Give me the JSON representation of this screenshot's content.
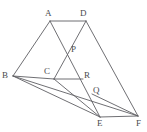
{
  "figure": {
    "canvas": {
      "width": 147,
      "height": 132
    },
    "background_color": "#ffffff",
    "stroke_color": "#5f5f63",
    "label_color": "#4a4a4e",
    "points": [
      {
        "id": "A",
        "label": "A",
        "x": 50,
        "y": 21,
        "label_x": 45,
        "label_y": 9,
        "kind": "vertex"
      },
      {
        "id": "D",
        "label": "D",
        "x": 86,
        "y": 21,
        "label_x": 80,
        "label_y": 9,
        "kind": "vertex"
      },
      {
        "id": "P",
        "label": "P",
        "x": 70,
        "y": 50,
        "label_x": 71,
        "label_y": 46,
        "kind": "intersection"
      },
      {
        "id": "B",
        "label": "B",
        "x": 13,
        "y": 76,
        "label_x": 2,
        "label_y": 71,
        "kind": "vertex"
      },
      {
        "id": "C",
        "label": "C",
        "x": 54,
        "y": 79,
        "label_x": 44,
        "label_y": 67,
        "kind": "vertex"
      },
      {
        "id": "R",
        "label": "R",
        "x": 82,
        "y": 79,
        "label_x": 84,
        "label_y": 71,
        "kind": "point"
      },
      {
        "id": "Q",
        "label": "Q",
        "x": 92,
        "y": 94,
        "label_x": 93,
        "label_y": 87,
        "kind": "intersection"
      },
      {
        "id": "E",
        "label": "E",
        "x": 100,
        "y": 117,
        "label_x": 97,
        "label_y": 119,
        "kind": "vertex"
      },
      {
        "id": "F",
        "label": "F",
        "x": 138,
        "y": 116,
        "label_x": 137,
        "label_y": 119,
        "kind": "vertex"
      }
    ],
    "segments": [
      {
        "name": "segment-AD",
        "from": "A",
        "to": "D"
      },
      {
        "name": "segment-AB",
        "from": "A",
        "to": "B"
      },
      {
        "name": "segment-AE",
        "from": "A",
        "to": "E"
      },
      {
        "name": "segment-DC",
        "from": "D",
        "to": "C"
      },
      {
        "name": "segment-DF",
        "from": "D",
        "to": "F"
      },
      {
        "name": "segment-BC",
        "from": "B",
        "to": "C"
      },
      {
        "name": "segment-CR",
        "from": "C",
        "to": "R"
      },
      {
        "name": "segment-BE",
        "from": "B",
        "to": "E"
      },
      {
        "name": "segment-BF",
        "from": "B",
        "to": "F"
      },
      {
        "name": "segment-CE",
        "from": "C",
        "to": "E"
      },
      {
        "name": "segment-EF",
        "from": "E",
        "to": "F"
      },
      {
        "name": "segment-QF",
        "from": "Q",
        "to": "F"
      }
    ]
  }
}
